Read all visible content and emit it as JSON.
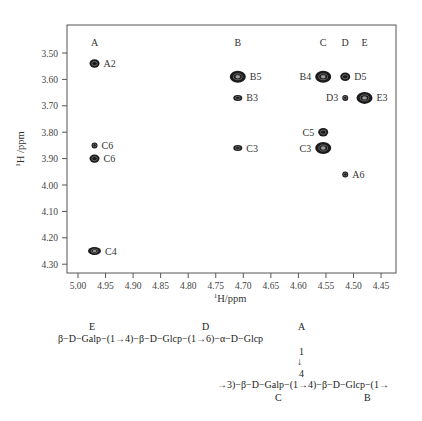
{
  "chart_data": {
    "type": "scatter",
    "subtype": "2D NMR (HSQC/TOCSY-style) cross-peak map",
    "title": "",
    "xlabel": "1H/ppm",
    "ylabel": "1H /ppm",
    "x_axis": {
      "reversed": true,
      "range": [
        5.02,
        4.42
      ],
      "ticks": [
        "5.00",
        "4.95",
        "4.90",
        "4.85",
        "4.80",
        "4.75",
        "4.70",
        "4.65",
        "4.60",
        "4.55",
        "4.50",
        "4.45"
      ]
    },
    "y_axis": {
      "reversed": true,
      "range": [
        3.41,
        4.34
      ],
      "ticks": [
        "3.50",
        "3.60",
        "3.70",
        "3.80",
        "3.90",
        "4.00",
        "4.10",
        "4.20",
        "4.30"
      ]
    },
    "grid": false,
    "legend": null,
    "column_labels": [
      {
        "label": "A",
        "x": 4.97
      },
      {
        "label": "B",
        "x": 4.71
      },
      {
        "label": "C",
        "x": 4.555
      },
      {
        "label": "D",
        "x": 4.515
      },
      {
        "label": "E",
        "x": 4.48
      }
    ],
    "peaks": [
      {
        "label": "A2",
        "x": 4.97,
        "y": 3.54,
        "size": "medium",
        "label_side": "right"
      },
      {
        "label": "C6",
        "x": 4.97,
        "y": 3.85,
        "size": "small",
        "label_side": "right"
      },
      {
        "label": "C6",
        "x": 4.97,
        "y": 3.9,
        "size": "medium",
        "label_side": "right"
      },
      {
        "label": "C4",
        "x": 4.97,
        "y": 4.25,
        "size": "medium-wide",
        "label_side": "right"
      },
      {
        "label": "B5",
        "x": 4.71,
        "y": 3.59,
        "size": "large",
        "label_side": "right"
      },
      {
        "label": "B3",
        "x": 4.71,
        "y": 3.67,
        "size": "small-wide",
        "label_side": "right"
      },
      {
        "label": "C3",
        "x": 4.71,
        "y": 3.86,
        "size": "small-wide",
        "label_side": "right"
      },
      {
        "label": "B4",
        "x": 4.555,
        "y": 3.59,
        "size": "large",
        "label_side": "left"
      },
      {
        "label": "D5",
        "x": 4.515,
        "y": 3.59,
        "size": "medium",
        "label_side": "right"
      },
      {
        "label": "D3",
        "x": 4.515,
        "y": 3.67,
        "size": "small",
        "label_side": "left"
      },
      {
        "label": "E3",
        "x": 4.48,
        "y": 3.67,
        "size": "large",
        "label_side": "right"
      },
      {
        "label": "C5",
        "x": 4.555,
        "y": 3.8,
        "size": "medium",
        "label_side": "left"
      },
      {
        "label": "C3",
        "x": 4.555,
        "y": 3.86,
        "size": "large",
        "label_side": "left"
      },
      {
        "label": "A6",
        "x": 4.515,
        "y": 3.96,
        "size": "small",
        "label_side": "right"
      }
    ]
  },
  "scheme": {
    "residue_labels_top": {
      "E": "E",
      "D": "D",
      "A": "A"
    },
    "line1": "β−D−Galp−(1→4)−β−D−Glcp−(1→6)−α−D−Glcp",
    "link_top": "1",
    "link_arrow": "↓",
    "link_bottom": "4",
    "line2": "→3)−β−D−Galp−(1→4)−β−D−Glcp−(1→",
    "residue_labels_bottom": {
      "C": "C",
      "B": "B"
    }
  }
}
